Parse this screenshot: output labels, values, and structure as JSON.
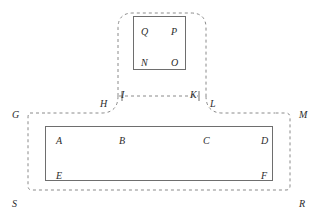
{
  "diagram": {
    "background_color": "#ffffff",
    "dashed_stroke_color": "#8a8a8a",
    "solid_stroke_color": "#6e6e6e",
    "label_color": "#2b2b2b",
    "labels": [
      {
        "id": "Q",
        "text": "Q",
        "x": 141,
        "y": 27,
        "region": "upper-inner-box",
        "corner": "top-left"
      },
      {
        "id": "P",
        "text": "P",
        "x": 171,
        "y": 27,
        "region": "upper-inner-box",
        "corner": "top-right"
      },
      {
        "id": "N",
        "text": "N",
        "x": 141,
        "y": 58,
        "region": "upper-inner-box",
        "corner": "bottom-left"
      },
      {
        "id": "O",
        "text": "O",
        "x": 171,
        "y": 58,
        "region": "upper-inner-box",
        "corner": "bottom-right"
      },
      {
        "id": "H",
        "text": "H",
        "x": 100,
        "y": 99,
        "region": "stem",
        "corner": "left-outside"
      },
      {
        "id": "I",
        "text": "I",
        "x": 121,
        "y": 93,
        "region": "stem",
        "corner": "left-neck"
      },
      {
        "id": "K",
        "text": "K",
        "x": 190,
        "y": 93,
        "region": "stem",
        "corner": "right-neck"
      },
      {
        "id": "L",
        "text": "L",
        "x": 210,
        "y": 99,
        "region": "stem",
        "corner": "right-outside"
      },
      {
        "id": "G",
        "text": "G",
        "x": 12,
        "y": 110,
        "region": "lower-dashed",
        "corner": "top-left"
      },
      {
        "id": "M",
        "text": "M",
        "x": 299,
        "y": 110,
        "region": "lower-dashed",
        "corner": "top-right"
      },
      {
        "id": "S",
        "text": "S",
        "x": 12,
        "y": 199,
        "region": "lower-dashed",
        "corner": "bottom-left"
      },
      {
        "id": "R",
        "text": "R",
        "x": 299,
        "y": 199,
        "region": "lower-dashed",
        "corner": "bottom-right"
      },
      {
        "id": "A",
        "text": "A",
        "x": 56,
        "y": 136,
        "region": "lower-inner-box",
        "corner": "top-left"
      },
      {
        "id": "B",
        "text": "B",
        "x": 119,
        "y": 136,
        "region": "lower-inner-box",
        "corner": "top-mid-left"
      },
      {
        "id": "C",
        "text": "C",
        "x": 203,
        "y": 136,
        "region": "lower-inner-box",
        "corner": "top-mid-right"
      },
      {
        "id": "D",
        "text": "D",
        "x": 261,
        "y": 136,
        "region": "lower-inner-box",
        "corner": "top-right"
      },
      {
        "id": "E",
        "text": "E",
        "x": 56,
        "y": 171,
        "region": "lower-inner-box",
        "corner": "bottom-left"
      },
      {
        "id": "F",
        "text": "F",
        "x": 261,
        "y": 171,
        "region": "lower-inner-box",
        "corner": "bottom-right"
      }
    ],
    "shapes": {
      "upper_dashed_outline": "rounded T-head from x=108..215, y=12..100 joining stem",
      "stem_dashed_line": "horizontal dashed segment y=96 from x=118 to x=195",
      "lower_dashed_rect": "x=30..288, y=114..190, rounded corners",
      "upper_solid_rect": "x=133..185, y=16..70",
      "lower_solid_rect": "x=45..272, y=126..180"
    }
  }
}
